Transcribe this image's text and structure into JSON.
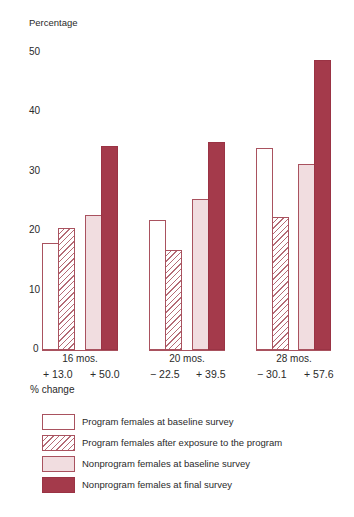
{
  "chart_data": {
    "type": "bar",
    "title": "",
    "xlabel": "",
    "ylabel": "Percentage",
    "ylim": [
      0,
      50
    ],
    "yticks": [
      0,
      10,
      20,
      30,
      40,
      50
    ],
    "grid": false,
    "legend_position": "bottom",
    "categories": [
      "16 mos.",
      "20 mos.",
      "28 mos."
    ],
    "series": [
      {
        "name": "Program females at baseline survey",
        "values": [
          18.0,
          21.9,
          34.0
        ],
        "color": "#ffffff",
        "pattern": "outline"
      },
      {
        "name": "Program females after exposure to the program",
        "values": [
          20.5,
          16.8,
          22.4
        ],
        "color": "#ffffff",
        "pattern": "hatched"
      },
      {
        "name": "Nonprogram females at baseline survey",
        "values": [
          22.7,
          25.4,
          31.3
        ],
        "color": "#f1dde0",
        "pattern": "solid"
      },
      {
        "name": "Nonprogram females at final survey",
        "values": [
          34.4,
          35.0,
          48.8
        ],
        "color": "#a43a4b",
        "pattern": "solid"
      }
    ],
    "annotations": {
      "percent_change_label": "% change",
      "program_change": [
        "+13.0",
        "−22.5",
        "−30.1"
      ],
      "nonprogram_change": [
        "+50.0",
        "+39.5",
        "+57.6"
      ]
    }
  },
  "axis": {
    "ylabel": "Percentage",
    "ticks": [
      "50",
      "40",
      "30",
      "20",
      "10",
      "0"
    ]
  },
  "groups": [
    {
      "label": "16 mos.",
      "program_change": "+ 13.0",
      "nonprogram_change": "+ 50.0"
    },
    {
      "label": "20 mos.",
      "program_change": "− 22.5",
      "nonprogram_change": "+ 39.5"
    },
    {
      "label": "28 mos.",
      "program_change": "− 30.1",
      "nonprogram_change": "+ 57.6"
    }
  ],
  "change_label": "% change",
  "legend": [
    {
      "label": "Program females at baseline survey"
    },
    {
      "label": "Program females after exposure to the program"
    },
    {
      "label": "Nonprogram females at baseline survey"
    },
    {
      "label": "Nonprogram females at final survey"
    }
  ]
}
